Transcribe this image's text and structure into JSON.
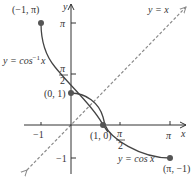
{
  "figure": {
    "colors": {
      "axis": "#333333",
      "curve": "#444444",
      "dashed_line": "#8a8a8a",
      "point": "#555555",
      "text": "#333333"
    },
    "axes": {
      "x_label": "x",
      "y_label": "y",
      "x_ticks": [
        {
          "value": -1,
          "label": "−1"
        },
        {
          "value": 1.5708,
          "label_num": "π",
          "label_den": "2"
        },
        {
          "value": 3.1416,
          "label": "π"
        }
      ],
      "y_ticks": [
        {
          "value": 3.1416,
          "label": "π"
        },
        {
          "value": 1.5708,
          "label_num": "π",
          "label_den": "2"
        },
        {
          "value": -1,
          "label": "−1"
        }
      ]
    },
    "curves": [
      {
        "name": "arccos",
        "label": "y = cos",
        "sup": "−1",
        "var": "x",
        "domain": [
          -1,
          1
        ]
      },
      {
        "name": "cos",
        "label": "y = cos x",
        "domain": [
          0,
          3.1416
        ]
      },
      {
        "name": "identity",
        "label": "y = x",
        "style": "dashed"
      }
    ],
    "points": [
      {
        "label": "(−1, π)",
        "x": -1,
        "y": 3.1416
      },
      {
        "label": "(0, 1)",
        "x": 0,
        "y": 1
      },
      {
        "label": "(1, 0)",
        "x": 1,
        "y": 0
      },
      {
        "label": "(π, −1)",
        "x": 3.1416,
        "y": -1
      }
    ]
  }
}
